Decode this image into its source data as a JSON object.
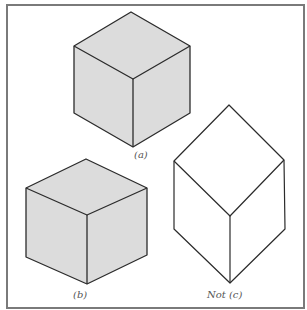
{
  "figure": {
    "colors": {
      "face_fill": "#dcdcdc",
      "stroke": "#2b2b2b",
      "border": "#7a7a7a",
      "label": "#555555"
    },
    "shapes": [
      {
        "id": "a",
        "label": "(a)",
        "filled": true,
        "description": "shaded cube viewed from above",
        "vertices": {
          "top": [
            131,
            12
          ],
          "left_top": [
            74,
            46
          ],
          "right_top": [
            190,
            46
          ],
          "center": [
            133,
            79
          ],
          "left_bottom": [
            74,
            113
          ],
          "right_bottom": [
            190,
            113
          ],
          "bottom": [
            133,
            147
          ]
        }
      },
      {
        "id": "b",
        "label": "(b)",
        "filled": true,
        "description": "shaded cube viewed from above",
        "vertices": {
          "top": [
            86,
            159
          ],
          "left_top": [
            26,
            188
          ],
          "right_top": [
            147,
            188
          ],
          "center": [
            87,
            215
          ],
          "left_bottom": [
            26,
            257
          ],
          "right_bottom": [
            147,
            255
          ],
          "bottom": [
            87,
            284
          ]
        }
      },
      {
        "id": "c",
        "label": "Not (c)",
        "filled": false,
        "description": "unshaded elongated hexagonal outline, not a cube",
        "vertices": {
          "top": [
            229,
            105
          ],
          "left_top": [
            174,
            161
          ],
          "right_top": [
            284,
            160
          ],
          "center": [
            230,
            216
          ],
          "left_bottom": [
            174,
            229
          ],
          "right_bottom": [
            285,
            229
          ],
          "bottom": [
            230,
            283
          ]
        }
      }
    ]
  }
}
